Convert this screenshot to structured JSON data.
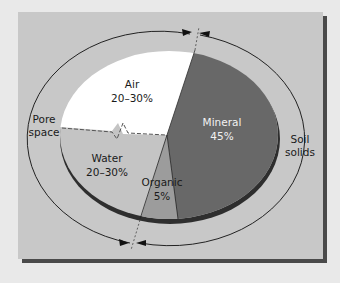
{
  "diagram": {
    "colors": {
      "panel": "#c8c8c8",
      "panel_shadow": "#4a4a4a",
      "background": "#ececec",
      "mineral": "#686868",
      "organic": "#9c9c9c",
      "water": "#c4c4c4",
      "air": "#ffffff",
      "rim": "#2e2e2e"
    },
    "slices": [
      {
        "name": "Air",
        "value": "20–30%",
        "group": "Pore space"
      },
      {
        "name": "Water",
        "value": "20–30%",
        "group": "Pore space"
      },
      {
        "name": "Organic",
        "value": "5%",
        "group": "Soil solids"
      },
      {
        "name": "Mineral",
        "value": "45%",
        "group": "Soil solids"
      }
    ],
    "labels": {
      "air_name": "Air",
      "air_value": "20–30%",
      "water_name": "Water",
      "water_value": "20–30%",
      "organic_name": "Organic",
      "organic_value": "5%",
      "mineral_name": "Mineral",
      "mineral_value": "45%",
      "pore_line1": "Pore",
      "pore_line2": "space",
      "solids_line1": "Soil",
      "solids_line2": "solids"
    }
  }
}
